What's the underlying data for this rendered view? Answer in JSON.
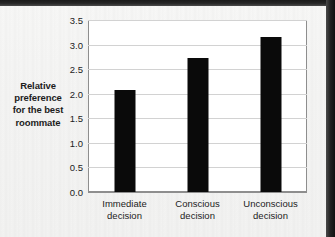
{
  "chart_data": {
    "type": "bar",
    "title": "",
    "subtitle": "",
    "xlabel": "",
    "ylabel": "Relative preference for the best roommate",
    "ylabel_lines": [
      "Relative",
      "preference",
      "for the best",
      "roommate"
    ],
    "categories": [
      "Immediate decision",
      "Conscious decision",
      "Unconscious decision"
    ],
    "category_lines": [
      [
        "Immediate",
        "decision"
      ],
      [
        "Conscious",
        "decision"
      ],
      [
        "Unconscious",
        "decision"
      ]
    ],
    "values": [
      2.08,
      2.72,
      3.16
    ],
    "ylim": [
      0.0,
      3.5
    ],
    "yticks": [
      0.0,
      0.5,
      1.0,
      1.5,
      2.0,
      2.5,
      3.0,
      3.5
    ],
    "ytick_labels": [
      "0.0",
      "0.5",
      "1.0",
      "1.5",
      "2.0",
      "2.5",
      "3.0",
      "3.5"
    ],
    "grid": true,
    "legend": false,
    "legend_position": "none",
    "bar_color": "#0a0a0a",
    "gridline_color": "#d2d2d2",
    "axis_color": "#8e8e8e",
    "plot_background": "#ffffff",
    "page_background": "#f4f4f3"
  }
}
